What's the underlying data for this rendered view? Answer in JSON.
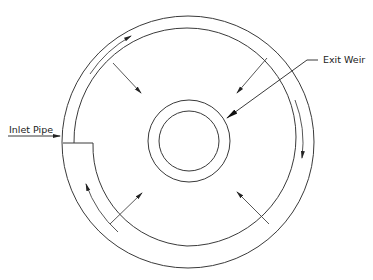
{
  "diagram": {
    "labels": {
      "inlet": "Inlet Pipe",
      "exit": "Exit Weir"
    },
    "colors": {
      "stroke": "#3a3a3a",
      "background": "#ffffff"
    },
    "elements": [
      {
        "name": "outer-tank-wall",
        "kind": "circle"
      },
      {
        "name": "inner-spiral-baffle",
        "kind": "spiral"
      },
      {
        "name": "exit-weir-ring-outer",
        "kind": "circle"
      },
      {
        "name": "exit-weir-ring-inner",
        "kind": "circle"
      },
      {
        "name": "inlet-pipe",
        "kind": "pipe"
      },
      {
        "name": "flow-arrows-channel",
        "count": 3,
        "direction": "clockwise"
      },
      {
        "name": "flow-arrows-radial",
        "count": 4,
        "direction": "inward"
      }
    ]
  }
}
